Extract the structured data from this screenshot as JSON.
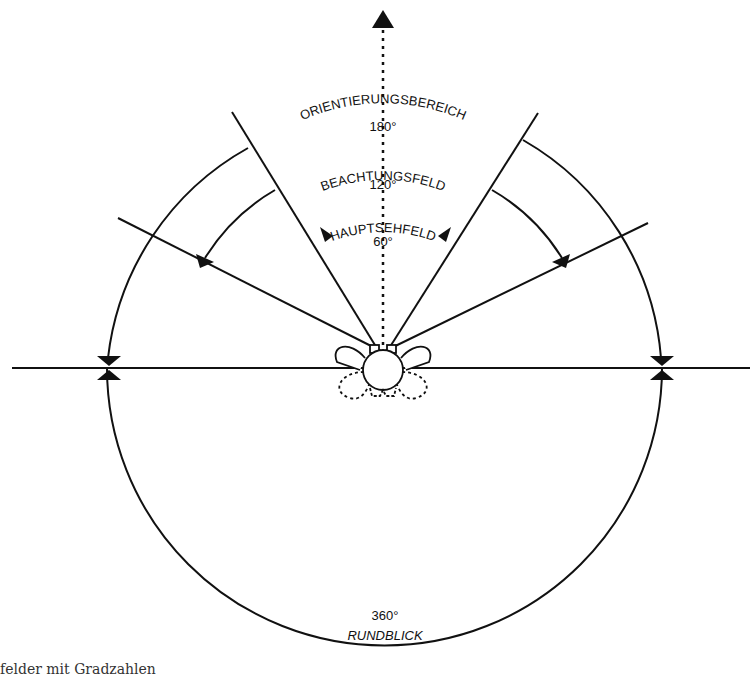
{
  "diagram": {
    "colors": {
      "stroke": "#111111",
      "background": "#ffffff"
    },
    "fields": [
      {
        "name": "ORIENTIERUNGSBEREICH",
        "degrees": "180°"
      },
      {
        "name": "BEACHTUNGSFELD",
        "degrees": "120°"
      },
      {
        "name": "HAUPTSEHFELD",
        "degrees": "60°"
      }
    ],
    "panorama": {
      "name": "RUNDBLICK",
      "degrees": "360°"
    }
  },
  "caption": "felder mit Gradzahlen"
}
